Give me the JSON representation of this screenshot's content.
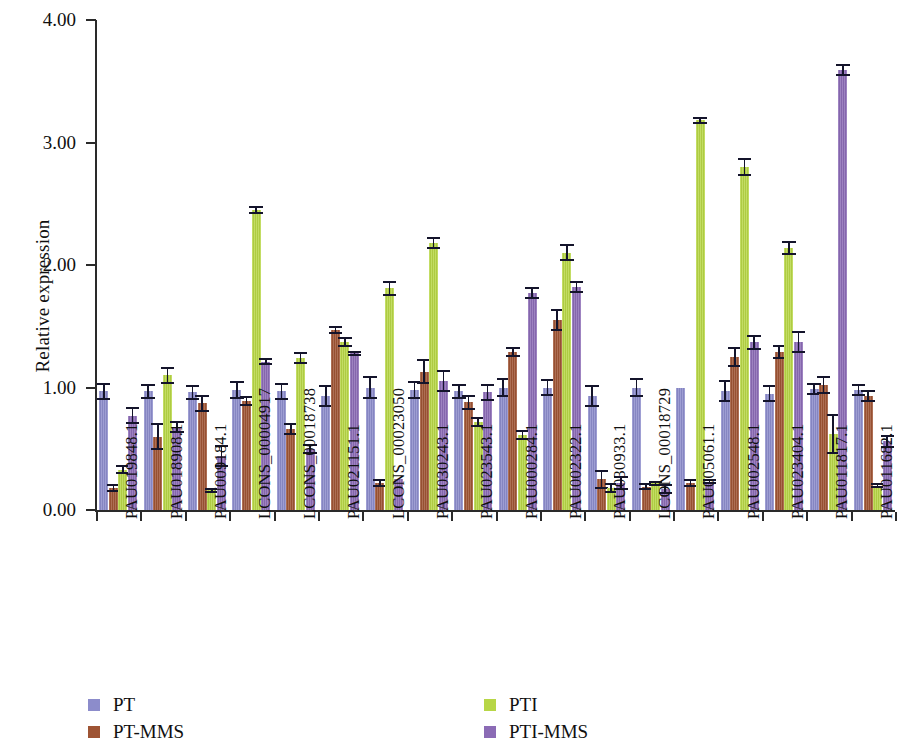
{
  "chart_data": {
    "type": "bar",
    "title": "",
    "xlabel": "",
    "ylabel": "Relative expression",
    "ylim": [
      0,
      4.0
    ],
    "ytick_labels": [
      "0.00",
      "1.00",
      "2.00",
      "3.00",
      "4.00"
    ],
    "ytick_values": [
      0.0,
      1.0,
      2.0,
      3.0,
      4.0
    ],
    "grid": false,
    "legend_position": "bottom",
    "error_bars": true,
    "colors": {
      "PT": "#8c8ccb",
      "PT-MMS": "#9e5434",
      "PTI": "#b7d646",
      "PTI-MMS": "#8b6bb5"
    },
    "categories": [
      "PAU019848.1",
      "PAU018908.1",
      "PAU009184.1",
      "LCONS_00004917",
      "LCONS_00018738",
      "PAU021151.1",
      "LCONS_00023050",
      "PAU030243.1",
      "PAU023543.1",
      "PAU000284.1",
      "PAU002322.1",
      "PAU030933.1",
      "LCONS_00018729",
      "PAU005061.1",
      "PAU002548.1",
      "PAU023404.1",
      "PAU011817.1",
      "PAU011682.1"
    ],
    "series": [
      {
        "name": "PT",
        "color": "#8c8ccb",
        "values": [
          0.97,
          0.97,
          0.96,
          0.98,
          0.97,
          0.93,
          1.0,
          0.98,
          0.97,
          1.0,
          1.0,
          0.93,
          1.0,
          1.0,
          0.97,
          0.95,
          0.99,
          0.98
        ],
        "errors": [
          0.07,
          0.06,
          0.06,
          0.07,
          0.07,
          0.09,
          0.09,
          0.07,
          0.06,
          0.08,
          0.07,
          0.09,
          0.08,
          0.0,
          0.09,
          0.07,
          0.05,
          0.05
        ]
      },
      {
        "name": "PT-MMS",
        "color": "#9e5434",
        "values": [
          0.18,
          0.6,
          0.87,
          0.89,
          0.66,
          1.47,
          0.22,
          1.13,
          0.88,
          1.29,
          1.55,
          0.25,
          0.19,
          0.22,
          1.25,
          1.29,
          1.02,
          0.93
        ],
        "errors": [
          0.03,
          0.11,
          0.07,
          0.04,
          0.05,
          0.03,
          0.03,
          0.1,
          0.06,
          0.04,
          0.09,
          0.08,
          0.03,
          0.03,
          0.08,
          0.06,
          0.07,
          0.05
        ]
      },
      {
        "name": "PTI",
        "color": "#b7d646",
        "values": [
          0.33,
          1.1,
          0.16,
          2.45,
          1.24,
          1.37,
          1.81,
          2.18,
          0.72,
          0.61,
          2.1,
          0.18,
          0.22,
          3.18,
          2.8,
          2.14,
          0.62,
          0.2
        ],
        "errors": [
          0.04,
          0.07,
          0.02,
          0.03,
          0.05,
          0.04,
          0.06,
          0.05,
          0.04,
          0.04,
          0.07,
          0.04,
          0.02,
          0.03,
          0.07,
          0.06,
          0.16,
          0.02
        ]
      },
      {
        "name": "PTI-MMS",
        "color": "#8b6bb5",
        "values": [
          0.77,
          0.68,
          0.44,
          1.21,
          0.5,
          1.28,
          0.25,
          1.05,
          0.96,
          1.77,
          1.82,
          0.22,
          0.17,
          0.23,
          1.37,
          1.37,
          3.59,
          0.56
        ]
      }
    ],
    "series_errors_ptimms": [
      0.07,
      0.05,
      0.09,
      0.03,
      0.04,
      0.02,
      0.0,
      0.09,
      0.07,
      0.05,
      0.05,
      0.06,
      0.04,
      0.02,
      0.06,
      0.09,
      0.05,
      0.05
    ],
    "legend": [
      {
        "label": "PT",
        "color": "#8c8ccb"
      },
      {
        "label": "PT-MMS",
        "color": "#9e5434"
      },
      {
        "label": "PTI",
        "color": "#b7d646"
      },
      {
        "label": "PTI-MMS",
        "color": "#8b6bb5"
      }
    ]
  }
}
